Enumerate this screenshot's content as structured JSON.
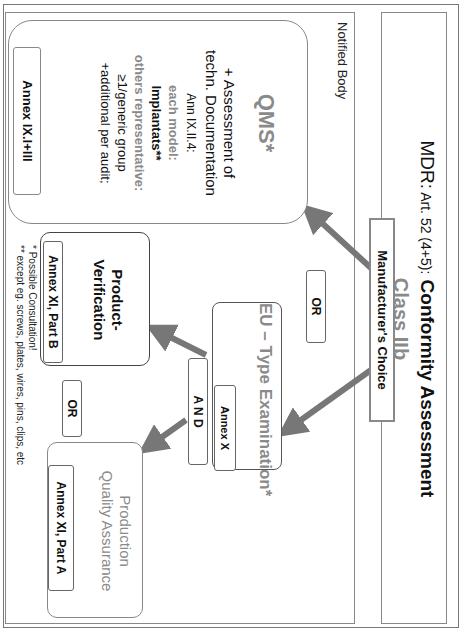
{
  "title": {
    "prefix": "MDR:",
    "article": " Art. 52 (4+5):",
    "main": " Conformity Assessment",
    "class_label": "Class IIb"
  },
  "manufacturer_choice": "Manufacturer's Choice",
  "notified_body_label": "Notified Body",
  "qms": {
    "title": "QMS*",
    "lines": [
      "+ Assessment of",
      "techn. Documentation",
      "Ann IX.II.4:",
      "each model:",
      "Implantats**",
      "others representative:",
      "≥1/generic group",
      "+additional per audit;"
    ],
    "annex": "Annex IX.I+III"
  },
  "or_top": "OR",
  "eu_type": {
    "title": "EU – Type Examination*",
    "annex": "Annex X"
  },
  "and_label": "A N D",
  "product_verification": {
    "title_line1": "Product-",
    "title_line2": "Verification",
    "annex": "Annex XI, Part B"
  },
  "or_bottom": "OR",
  "production_qa": {
    "title_line1": "Production",
    "title_line2": "Quality Assurance",
    "annex": "Annex XI, Part A"
  },
  "footnotes": {
    "note1": "* Possible Consultation!",
    "note2": "** except eg. screws, plates, wires, pins, clips, etc"
  },
  "colors": {
    "arrow": "#777777",
    "grey_text": "#8a8a8a",
    "border": "#888888"
  }
}
